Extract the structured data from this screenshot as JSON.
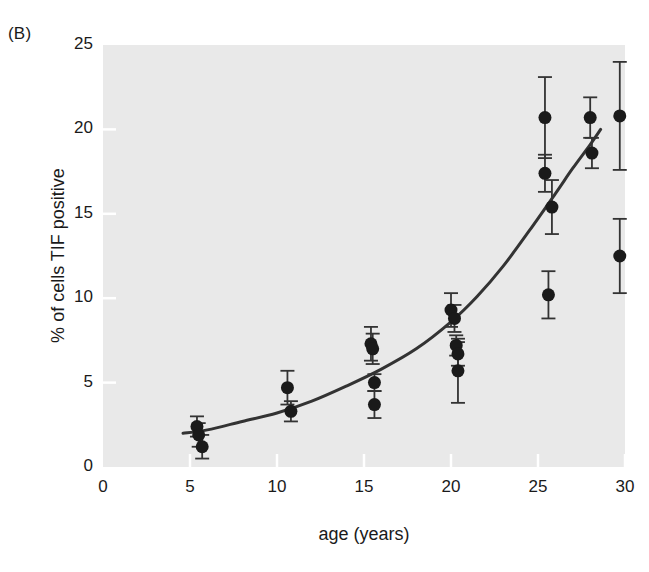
{
  "panel": {
    "label": "(B)"
  },
  "chart_data": {
    "type": "scatter",
    "title": "",
    "subtitle": "",
    "xlabel": "age (years)",
    "ylabel": "% of cells TIF positive",
    "xlim": [
      0,
      30
    ],
    "ylim": [
      0,
      25
    ],
    "xticks": [
      0,
      5,
      10,
      15,
      20,
      25,
      30
    ],
    "yticks": [
      0,
      5,
      10,
      15,
      20,
      25
    ],
    "xtick_labels": [
      "0",
      "5",
      "10",
      "15",
      "20",
      "25",
      "30"
    ],
    "ytick_labels": [
      "0",
      "5",
      "10",
      "15",
      "20",
      "25"
    ],
    "grid": false,
    "legend": null,
    "plot_background": "#e9e9e9",
    "marker_color": "#1a1a1a",
    "curve_color": "#333333",
    "errorbar_color": "#333333",
    "marker_shape": "circle",
    "marker_size_px": 13,
    "series": [
      {
        "name": "% of cells TIF positive",
        "points": [
          {
            "x": 5.4,
            "y": 2.4,
            "yerr": 0.6
          },
          {
            "x": 5.5,
            "y": 1.9,
            "yerr": 0.7
          },
          {
            "x": 5.7,
            "y": 1.2,
            "yerr": 0.7
          },
          {
            "x": 10.6,
            "y": 4.7,
            "yerr": 1.0
          },
          {
            "x": 10.8,
            "y": 3.3,
            "yerr": 0.6
          },
          {
            "x": 15.4,
            "y": 7.3,
            "yerr": 1.0
          },
          {
            "x": 15.5,
            "y": 7.0,
            "yerr": 0.9
          },
          {
            "x": 15.6,
            "y": 5.0,
            "yerr": 0.5
          },
          {
            "x": 15.6,
            "y": 3.7,
            "yerr": 0.8
          },
          {
            "x": 20.0,
            "y": 9.3,
            "yerr": 1.0
          },
          {
            "x": 20.2,
            "y": 8.8,
            "yerr": 0.8
          },
          {
            "x": 20.3,
            "y": 7.2,
            "yerr": 0.6
          },
          {
            "x": 20.4,
            "y": 6.7,
            "yerr": 0.7
          },
          {
            "x": 20.4,
            "y": 5.7,
            "yerr": 1.9
          },
          {
            "x": 25.4,
            "y": 20.7,
            "yerr": 2.4
          },
          {
            "x": 25.4,
            "y": 17.4,
            "yerr": 1.1
          },
          {
            "x": 25.8,
            "y": 15.4,
            "yerr": 1.6
          },
          {
            "x": 25.6,
            "y": 10.2,
            "yerr": 1.4
          },
          {
            "x": 28.0,
            "y": 20.7,
            "yerr": 1.2
          },
          {
            "x": 28.1,
            "y": 18.6,
            "yerr": 0.9
          },
          {
            "x": 29.7,
            "y": 20.8,
            "yerr": 3.2
          },
          {
            "x": 29.7,
            "y": 12.5,
            "yerr": 2.2
          }
        ]
      }
    ],
    "fit_curve": {
      "name": "exponential fit",
      "points": [
        {
          "x": 4.6,
          "y": 2.0
        },
        {
          "x": 6.0,
          "y": 2.2
        },
        {
          "x": 8.0,
          "y": 2.7
        },
        {
          "x": 10.0,
          "y": 3.2
        },
        {
          "x": 12.0,
          "y": 3.9
        },
        {
          "x": 14.0,
          "y": 4.8
        },
        {
          "x": 16.0,
          "y": 5.8
        },
        {
          "x": 18.0,
          "y": 7.0
        },
        {
          "x": 20.0,
          "y": 8.6
        },
        {
          "x": 21.5,
          "y": 10.1
        },
        {
          "x": 23.0,
          "y": 11.9
        },
        {
          "x": 24.5,
          "y": 14.0
        },
        {
          "x": 26.0,
          "y": 16.2
        },
        {
          "x": 27.0,
          "y": 17.7
        },
        {
          "x": 28.0,
          "y": 19.1
        },
        {
          "x": 28.6,
          "y": 20.0
        }
      ]
    }
  }
}
